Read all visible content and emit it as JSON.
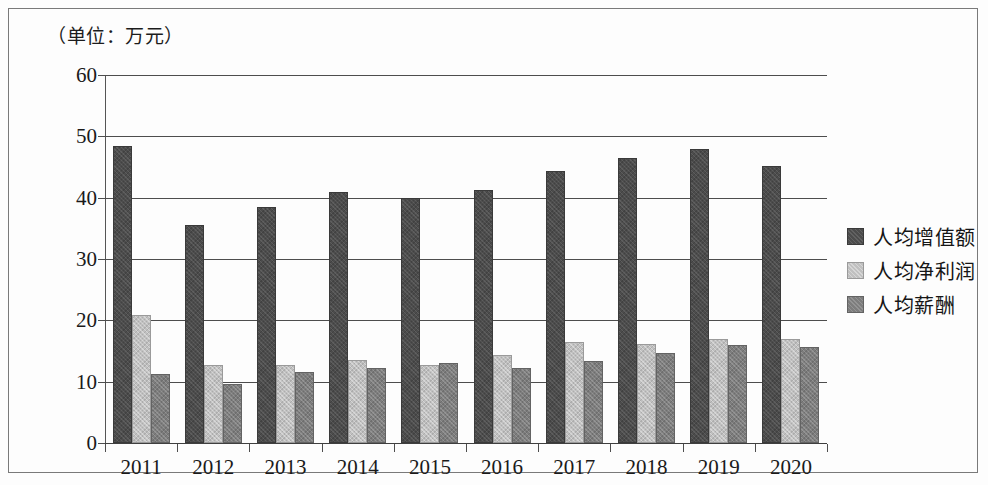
{
  "unit_note": "（单位：万元）",
  "chart_data": {
    "type": "bar",
    "title": "",
    "subtitle": "",
    "xlabel": "",
    "ylabel": "",
    "unit_label": "（单位：万元）",
    "categories": [
      "2011",
      "2012",
      "2013",
      "2014",
      "2015",
      "2016",
      "2017",
      "2018",
      "2019",
      "2020"
    ],
    "series": [
      {
        "name": "人均增值额",
        "color": "#4c4c4c",
        "values": [
          48.5,
          35.6,
          38.4,
          41.0,
          39.9,
          41.3,
          44.4,
          46.5,
          48.0,
          45.2
        ]
      },
      {
        "name": "人均净利润",
        "color": "#c0c0c0",
        "values": [
          20.9,
          12.7,
          12.8,
          13.6,
          12.7,
          14.3,
          16.4,
          16.1,
          17.0,
          17.0
        ]
      },
      {
        "name": "人均薪酬",
        "color": "#7d7d7d",
        "values": [
          11.3,
          9.6,
          11.6,
          12.3,
          13.0,
          12.3,
          13.3,
          14.7,
          16.0,
          15.7
        ]
      }
    ],
    "ylim": [
      0,
      60
    ],
    "yticks": [
      0,
      10,
      20,
      30,
      40,
      50,
      60
    ],
    "ytick_labels": [
      "0",
      "10",
      "20",
      "30",
      "40",
      "50",
      "60"
    ],
    "grid": true,
    "legend_position": "right",
    "legend_entries": [
      "人均增值额",
      "人均净利润",
      "人均薪酬"
    ]
  }
}
